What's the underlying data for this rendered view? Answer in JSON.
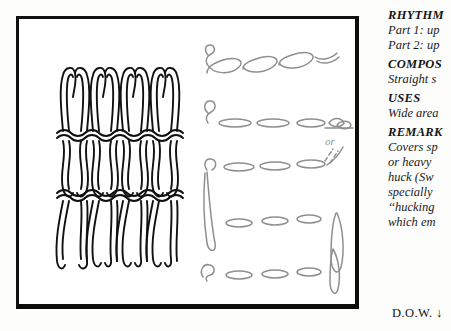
{
  "page": {
    "width": 451,
    "height": 331,
    "background": "#fdfdfc"
  },
  "figure": {
    "frame_color": "#0c0c0c",
    "caption_present": false,
    "weave_diagram": {
      "name": "woven-huck-stitch-pattern",
      "columns": 4,
      "rows": 3,
      "stroke": "#111111",
      "description": "vertical looped woven huck weaving pattern"
    },
    "step_diagram": {
      "name": "stitch-step-sequence",
      "stroke": "#8a8a8a",
      "rows": 5,
      "annotation": "or",
      "description": "grey outlined float stitches shown in progressive steps"
    }
  },
  "text_panel": {
    "blocks": [
      {
        "heading": "RHYTHM",
        "lines": [
          "Part 1: up",
          "Part 2: up"
        ]
      },
      {
        "heading": "COMPOS",
        "lines": [
          "Straight s"
        ]
      },
      {
        "heading": "USES",
        "lines": [
          "Wide area"
        ]
      },
      {
        "heading": "REMARK",
        "lines": [
          "Covers sp",
          "or heavy",
          "huck (Sw",
          "specially",
          "‘‘hucking",
          "which em"
        ]
      }
    ]
  },
  "footer": {
    "mark": "D.O.W. ↓"
  },
  "colors": {
    "ink": "#141414",
    "grey_ink": "#8a8a8a",
    "paper": "#fdfdfc"
  }
}
